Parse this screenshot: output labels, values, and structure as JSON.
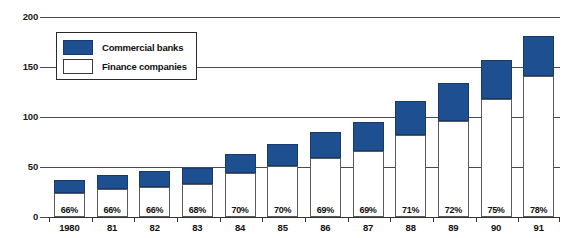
{
  "chart_data": {
    "type": "bar",
    "stacked": true,
    "title": "",
    "subtitle": "",
    "xlabel": "",
    "ylabel": "",
    "ylim": [
      0,
      200
    ],
    "yticks": [
      0,
      50,
      100,
      150,
      200
    ],
    "ytick_labels": [
      "0",
      "50",
      "100",
      "150",
      "200"
    ],
    "grid": true,
    "legend_position": "upper-left-inset",
    "categories": [
      "1980",
      "81",
      "82",
      "83",
      "84",
      "85",
      "86",
      "87",
      "88",
      "89",
      "90",
      "91"
    ],
    "series": [
      {
        "name": "Finance companies",
        "color": "#ffffff",
        "values": [
          24,
          28,
          30,
          33,
          44,
          51,
          59,
          66,
          82,
          96,
          118,
          141
        ]
      },
      {
        "name": "Commercial banks",
        "color": "#1e4f91",
        "values": [
          13,
          14,
          16,
          16,
          19,
          22,
          26,
          29,
          34,
          38,
          39,
          40
        ]
      }
    ],
    "totals": [
      37,
      42,
      46,
      49,
      63,
      73,
      85,
      95,
      116,
      134,
      157,
      181
    ],
    "data_labels": [
      "66%",
      "66%",
      "66%",
      "68%",
      "70%",
      "70%",
      "69%",
      "69%",
      "71%",
      "72%",
      "75%",
      "78%"
    ],
    "data_label_note": "Finance companies share of total"
  },
  "legend": {
    "entries": [
      {
        "label": "Commercial banks",
        "swatch": "blue"
      },
      {
        "label": "Finance companies",
        "swatch": "white"
      }
    ]
  }
}
